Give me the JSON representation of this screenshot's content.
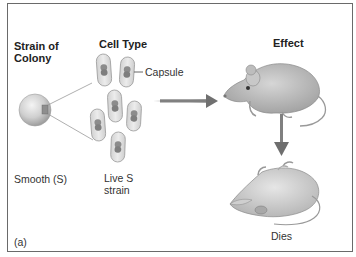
{
  "figure": {
    "panel_label": "(a)",
    "headings": {
      "strain": [
        "Strain of",
        "Colony"
      ],
      "cell_type": "Cell Type",
      "effect": "Effect"
    },
    "labels": {
      "capsule": "Capsule",
      "strain_name": "Smooth (S)",
      "cell_desc": [
        "Live S",
        "strain"
      ],
      "outcome": "Dies"
    },
    "colors": {
      "border": "#6a6a6a",
      "capsule_fill": "#e4e4e4",
      "capsule_stroke": "#9a9a9a",
      "nucleoid": "#8a8a8a",
      "arrow": "#7a7a7a",
      "mouse": "#b4b4b4"
    }
  }
}
